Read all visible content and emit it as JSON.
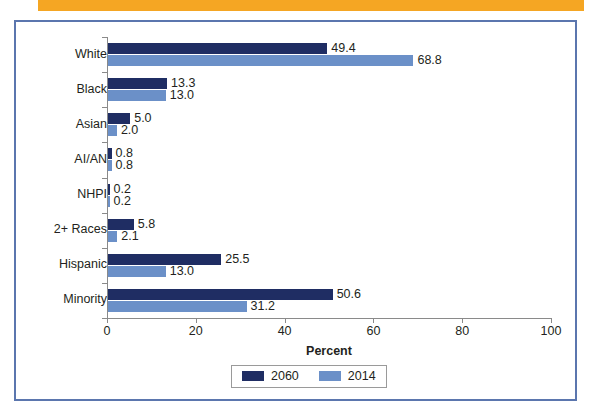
{
  "banner": {
    "color": "#F5A623"
  },
  "frame": {
    "border_color": "#5B76AE"
  },
  "legend": {
    "position": "bottom-center",
    "entries": [
      {
        "label": "2060",
        "color": "#1F2D63"
      },
      {
        "label": "2014",
        "color": "#6B90C8"
      }
    ]
  },
  "chart_data": {
    "type": "bar",
    "orientation": "horizontal",
    "title": "",
    "xlabel": "Percent",
    "ylabel": "",
    "xlim": [
      0,
      100
    ],
    "xticks": [
      "0",
      "20",
      "40",
      "60",
      "80",
      "100"
    ],
    "grid": false,
    "categories": [
      "White",
      "Black",
      "Asian",
      "AI/AN",
      "NHPI",
      "2+ Races",
      "Hispanic",
      "Minority"
    ],
    "series": [
      {
        "name": "2060",
        "color": "#1F2D63",
        "values": [
          49.4,
          13.3,
          5.0,
          0.8,
          0.2,
          5.8,
          25.5,
          50.6
        ],
        "labels": [
          "49.4",
          "13.3",
          "5.0",
          "0.8",
          "0.2",
          "5.8",
          "25.5",
          "50.6"
        ]
      },
      {
        "name": "2014",
        "color": "#6B90C8",
        "values": [
          68.8,
          13.0,
          2.0,
          0.8,
          0.2,
          2.1,
          13.0,
          31.2
        ],
        "labels": [
          "68.8",
          "13.0",
          "2.0",
          "0.8",
          "0.2",
          "2.1",
          "13.0",
          "31.2"
        ]
      }
    ]
  }
}
